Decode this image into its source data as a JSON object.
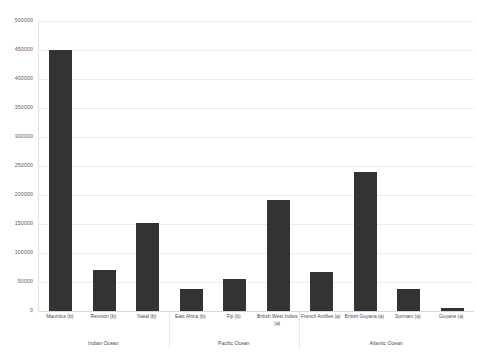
{
  "chart_data": {
    "type": "bar",
    "title": "",
    "xlabel": "",
    "ylabel": "",
    "ylim": [
      0,
      500000
    ],
    "grid": true,
    "legend": "none",
    "bar_color": "#333333",
    "categories": [
      "Mauritius (b)",
      "Reunion (b)",
      "Natal (b)",
      "East Africa (b)",
      "Fiji (b)",
      "British West Indies (a)",
      "French Antilles (a)",
      "British Guyana (a)",
      "Surinam (a)",
      "Guyane (a)"
    ],
    "values": [
      450000,
      70000,
      152000,
      38000,
      55000,
      192000,
      67000,
      240000,
      38000,
      5000
    ],
    "yticks": [
      0,
      50000,
      100000,
      150000,
      200000,
      250000,
      300000,
      350000,
      400000,
      450000,
      500000
    ],
    "ytick_labels": [
      "0",
      "50000",
      "100000",
      "150000",
      "200000",
      "250000",
      "300000",
      "350000",
      "400000",
      "450000",
      "500000"
    ],
    "groups": [
      {
        "label": "Indian Ocean",
        "start": 0,
        "end": 3
      },
      {
        "label": "Pacific Ocean",
        "start": 3,
        "end": 6
      },
      {
        "label": "Atlantic Ocean",
        "start": 6,
        "end": 10
      }
    ]
  }
}
